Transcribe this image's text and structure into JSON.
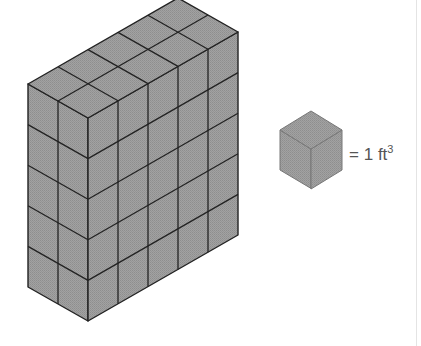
{
  "figure": {
    "prism": {
      "depth_cubes": 2,
      "width_cubes": 5,
      "height_cubes": 5,
      "total_cubes": 50
    },
    "colors": {
      "face": "#9c9c9c",
      "top": "#a4a4a4",
      "line": "#222222",
      "label": "#555555"
    }
  },
  "legend": {
    "equals": "=",
    "value": "1",
    "unit": "ft",
    "exponent": "3"
  }
}
